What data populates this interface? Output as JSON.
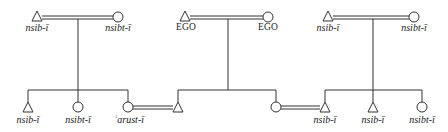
{
  "diagram": {
    "type": "kinship",
    "colors": {
      "line": "#333333",
      "background": "#ffffff"
    },
    "families": [
      {
        "id": "left",
        "parents": [
          {
            "sex": "male",
            "symbol": "triangle",
            "label": "nsib-ī",
            "x": 37,
            "y": 17
          },
          {
            "sex": "female",
            "symbol": "circle",
            "label": "nsibt-ī",
            "x": 118,
            "y": 17
          }
        ],
        "drop_x": 78,
        "children": [
          {
            "sex": "male",
            "symbol": "triangle",
            "label": "nsib-ī",
            "x": 28
          },
          {
            "sex": "female",
            "symbol": "circle",
            "label": "nsibt-ī",
            "x": 78
          },
          {
            "sex": "female",
            "symbol": "circle",
            "label": "ʿarust-ī",
            "x": 128
          }
        ]
      },
      {
        "id": "middle",
        "parents": [
          {
            "sex": "male",
            "symbol": "triangle",
            "label": "EGO",
            "x": 185,
            "y": 17
          },
          {
            "sex": "female",
            "symbol": "circle",
            "label": "EGO",
            "x": 268,
            "y": 17
          }
        ],
        "drop_x": 228,
        "children": [
          {
            "sex": "male",
            "symbol": "triangle",
            "label": "",
            "x": 178
          },
          {
            "sex": "female",
            "symbol": "circle",
            "label": "",
            "x": 276
          }
        ]
      },
      {
        "id": "right",
        "parents": [
          {
            "sex": "male",
            "symbol": "triangle",
            "label": "nsib-ī",
            "x": 328,
            "y": 17
          },
          {
            "sex": "female",
            "symbol": "circle",
            "label": "nsibt-ī",
            "x": 414,
            "y": 17
          }
        ],
        "drop_x": 373,
        "children": [
          {
            "sex": "male",
            "symbol": "triangle",
            "label": "nsib-ī",
            "x": 325
          },
          {
            "sex": "male",
            "symbol": "triangle",
            "label": "nsib-ī",
            "x": 373
          },
          {
            "sex": "female",
            "symbol": "circle",
            "label": "nsibt-ī",
            "x": 422
          }
        ]
      }
    ],
    "cross_marriages": [
      {
        "from": "left.children.2",
        "to": "middle.children.0"
      },
      {
        "from": "middle.children.1",
        "to": "right.children.0"
      }
    ],
    "labels": {
      "top_left_m": "nsib-ī",
      "top_left_f": "nsibt-ī",
      "top_mid_m": "EGO",
      "top_mid_f": "EGO",
      "top_right_m": "nsib-ī",
      "top_right_f": "nsibt-ī",
      "bot_l1": "nsib-ī",
      "bot_l2": "nsibt-ī",
      "bot_l3": "ʿarust-ī",
      "bot_r1": "nsib-ī",
      "bot_r2": "nsib-ī",
      "bot_r3": "nsibt-ī"
    }
  }
}
